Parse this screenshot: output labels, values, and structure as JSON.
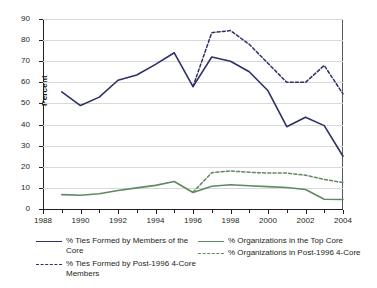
{
  "chart_data": {
    "type": "line",
    "title": "",
    "xlabel": "",
    "ylabel": "Percent",
    "xlim": [
      1988,
      2004
    ],
    "ylim": [
      0,
      90
    ],
    "ytick_step": 10,
    "yticks": [
      0,
      10,
      20,
      30,
      40,
      50,
      60,
      70,
      80,
      90
    ],
    "xticks": [
      1988,
      1990,
      1992,
      1994,
      1996,
      1998,
      2000,
      2002,
      2004
    ],
    "xticks_minor": [
      1989,
      1991,
      1993,
      1995,
      1997,
      1999,
      2001,
      2003
    ],
    "grid": "horizontal",
    "legend_position": "bottom",
    "colors": {
      "navy": "#2d3166",
      "green": "#5f8a5f",
      "gridline": "#d7d8da",
      "axis": "#231f20"
    },
    "series": [
      {
        "name": "% Ties Formed by Members of the Core",
        "style": "solid",
        "color": "#2d3166",
        "x": [
          1989,
          1990,
          1991,
          1992,
          1993,
          1994,
          1995,
          1996,
          1997,
          1998,
          1999,
          2000,
          2001,
          2002,
          2003,
          2004
        ],
        "values": [
          55.5,
          49.0,
          53.0,
          61.0,
          63.5,
          68.5,
          74.0,
          58.0,
          72.0,
          70.0,
          65.0,
          56.0,
          39.0,
          43.5,
          39.5,
          25.0
        ]
      },
      {
        "name": "% Ties Formed by Post-1996 4-Core Members",
        "style": "dashed",
        "color": "#2d3166",
        "x": [
          1996,
          1997,
          1998,
          1999,
          2000,
          2001,
          2002,
          2003,
          2004
        ],
        "values": [
          58.0,
          83.5,
          84.5,
          78.0,
          69.0,
          60.0,
          60.0,
          68.0,
          54.5
        ]
      },
      {
        "name": "% Organizations in the Top Core",
        "style": "solid",
        "color": "#5f8a5f",
        "x": [
          1989,
          1990,
          1991,
          1992,
          1993,
          1994,
          1995,
          1996,
          1997,
          1998,
          1999,
          2000,
          2001,
          2002,
          2003,
          2004
        ],
        "values": [
          6.8,
          6.5,
          7.2,
          8.8,
          10.0,
          11.2,
          13.0,
          7.8,
          10.8,
          11.5,
          11.0,
          10.6,
          10.2,
          9.2,
          4.6,
          4.5
        ]
      },
      {
        "name": "% Organizations in Post-1996 4-Core",
        "style": "dashed",
        "color": "#5f8a5f",
        "x": [
          1996,
          1997,
          1998,
          1999,
          2000,
          2001,
          2002,
          2003,
          2004
        ],
        "values": [
          8.0,
          17.2,
          18.0,
          17.4,
          17.0,
          17.0,
          16.0,
          14.0,
          12.5
        ]
      }
    ]
  },
  "legend": {
    "entries": [
      {
        "label": "% Ties Formed by Members of the Core",
        "color": "#2d3166",
        "style": "solid"
      },
      {
        "label": "% Ties Formed by Post-1996 4-Core Members",
        "color": "#2d3166",
        "style": "dashed"
      },
      {
        "label": "% Organizations in the Top Core",
        "color": "#5f8a5f",
        "style": "solid"
      },
      {
        "label": "% Organizations in Post-1996 4-Core",
        "color": "#5f8a5f",
        "style": "dashed"
      }
    ]
  }
}
